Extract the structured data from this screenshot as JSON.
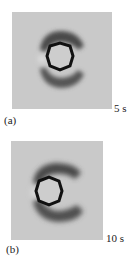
{
  "figure": {
    "panels": [
      {
        "label": "(a)",
        "time": "5 s"
      },
      {
        "label": "(b)",
        "time": "10 s"
      }
    ],
    "colors": {
      "background": "#c9c9c9",
      "shadow": "#555555",
      "outline": "#111111",
      "inner": "#cccccc"
    }
  }
}
